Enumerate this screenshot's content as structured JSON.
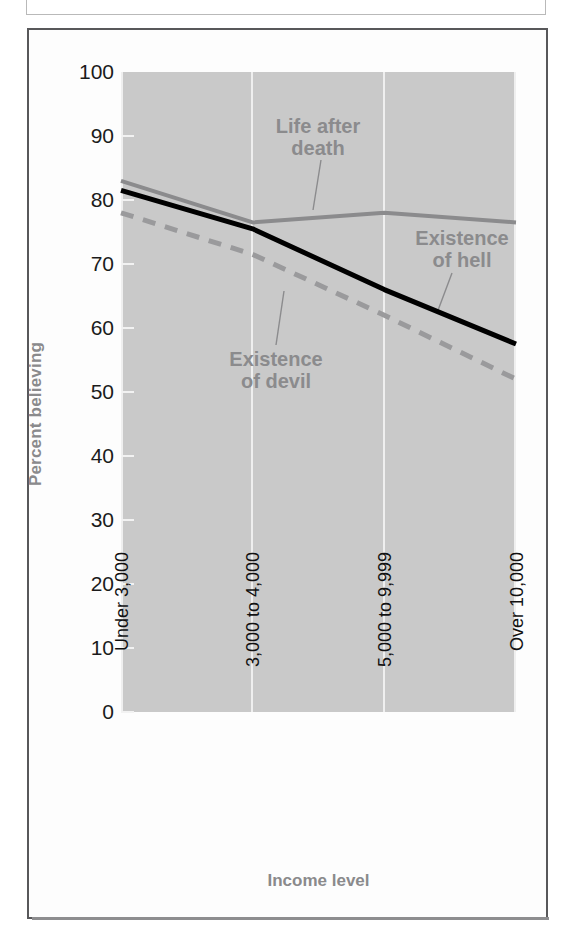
{
  "figure": {
    "frame_color": "#58585a",
    "plot_background": "#c9c9c9",
    "gridline_color": "#efefef"
  },
  "axis": {
    "y_title": "Percent believing",
    "x_title": "Income level",
    "y_ticks": [
      "100",
      "90",
      "80",
      "70",
      "60",
      "50",
      "40",
      "30",
      "20",
      "10",
      "0"
    ],
    "x_ticks": [
      "Under 3,000",
      "3,000 to 4,000",
      "5,000 to 9,999",
      "Over 10,000"
    ]
  },
  "annotations": {
    "life_after_death": "Life after\ndeath",
    "existence_of_hell": "Existence\nof hell",
    "existence_of_devil": "Existence\nof devil"
  },
  "chart_data": {
    "type": "line",
    "title": "",
    "subtitle": "",
    "xlabel": "Income level",
    "ylabel": "Percent believing",
    "categories": [
      "Under 3,000",
      "3,000 to 4,000",
      "5,000 to 9,999",
      "Over 10,000"
    ],
    "ylim": [
      0,
      100
    ],
    "yticks": [
      0,
      10,
      20,
      30,
      40,
      50,
      60,
      70,
      80,
      90,
      100
    ],
    "grid": "vertical-only",
    "legend": "inline-annotations",
    "series": [
      {
        "name": "Life after death",
        "values": [
          83,
          76.5,
          78,
          76.5
        ],
        "style": "solid",
        "color": "#8b8b8d",
        "width": 4
      },
      {
        "name": "Existence of hell",
        "values": [
          81.5,
          75.5,
          66,
          57.5
        ],
        "style": "solid",
        "color": "#000000",
        "width": 5
      },
      {
        "name": "Existence of devil",
        "values": [
          78,
          71.5,
          62,
          52
        ],
        "style": "dashed",
        "color": "#9a9a9c",
        "width": 5
      }
    ]
  }
}
